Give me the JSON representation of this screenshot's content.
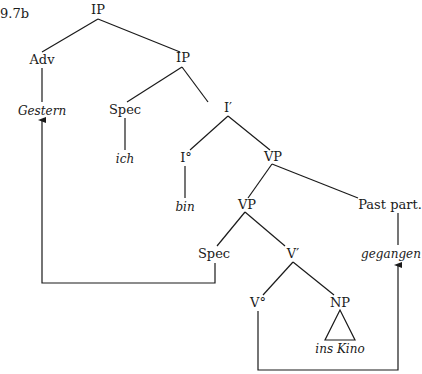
{
  "example_number": "9.7b",
  "nodes": {
    "ip_root": "IP",
    "adv": "Adv",
    "ip_inner": "IP",
    "gestern": "Gestern",
    "spec_upper": "Spec",
    "i_bar": "I′",
    "ich": "ich",
    "i_zero": "I°",
    "vp_upper": "VP",
    "bin": "bin",
    "vp_lower": "VP",
    "past_part": "Past part.",
    "spec_lower": "Spec",
    "v_bar": "V′",
    "gegangen": "gegangen",
    "v_zero": "V°",
    "np": "NP",
    "ins_kino": "ins Kino"
  },
  "movement_arrows": [
    {
      "from": "Spec (lower)",
      "to": "Gestern"
    },
    {
      "from": "V°",
      "to": "gegangen"
    }
  ]
}
